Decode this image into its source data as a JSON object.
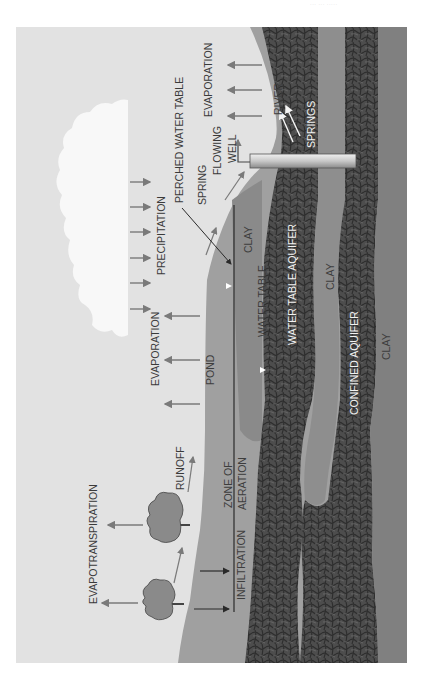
{
  "header": {
    "text": "··· ··· ·····"
  },
  "diagram": {
    "orientation": "rotated 90 degrees counter-clockwise",
    "colors": {
      "sky": "#e4e4e4",
      "cloud": "#fafafa",
      "soil": "#9a9a9a",
      "clay": "#8c8c8c",
      "aquifer_dark": "#4a4a4a",
      "clay_far": "#7e7e7e",
      "arrow": "#7a7a7a",
      "well": "#d0d0d0"
    },
    "labels": {
      "evapotranspiration": "EVAPOTRANSPIRATION",
      "runoff": "RUNOFF",
      "infiltration": "INFILTRATION",
      "zone_of_aeration_1": "ZONE OF",
      "zone_of_aeration_2": "AERATION",
      "evaporation_left": "EVAPORATION",
      "pond": "POND",
      "precipitation": "PRECIPITATION",
      "water_table": "WATER TABLE",
      "water_table_aquifer": "WATER TABLE AQUIFER",
      "clay_perched": "CLAY",
      "clay_middle": "CLAY",
      "clay_bottom": "CLAY",
      "confined_aquifer": "CONFINED AQUIFER",
      "perched_water_table": "PERCHED WATER TABLE",
      "spring": "SPRING",
      "flowing_well_1": "FLOWING",
      "flowing_well_2": "WELL",
      "evaporation_right": "EVAPORATION",
      "river": "RIVER",
      "springs": "SPRINGS"
    }
  }
}
